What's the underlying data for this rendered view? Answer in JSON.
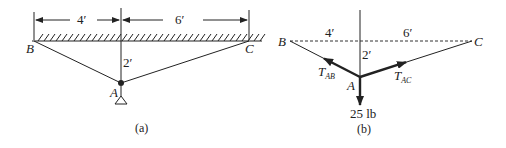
{
  "figure_a": {
    "caption": "(a)",
    "dim_left": "4′",
    "dim_right": "6′",
    "dim_vertical": "2′",
    "point_b": "B",
    "point_c": "C",
    "point_a": "A"
  },
  "figure_b": {
    "caption": "(b)",
    "dim_left": "4′",
    "dim_right": "6′",
    "dim_vertical": "2′",
    "point_b": "B",
    "point_c": "C",
    "point_a": "A",
    "tension_ab_main": "T",
    "tension_ab_sub": "AB",
    "tension_ac_main": "T",
    "tension_ac_sub": "AC",
    "load": "25 lb"
  },
  "colors": {
    "ink": "#222222"
  }
}
